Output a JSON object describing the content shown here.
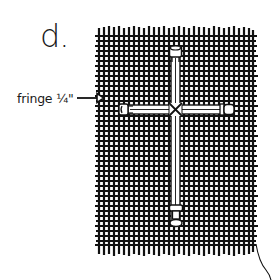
{
  "figure": {
    "step_label": "d.",
    "callout": {
      "text": "fringe ¼\"",
      "arrow": "arrow-right-icon"
    },
    "fabric": {
      "type": "woven burlap mesh",
      "color": "#111111"
    },
    "cross": {
      "type": "twig cross with wrapped center and capped ends",
      "color": "#ffffff"
    },
    "thread": {
      "description": "loose thread trailing from bottom-right corner"
    }
  }
}
